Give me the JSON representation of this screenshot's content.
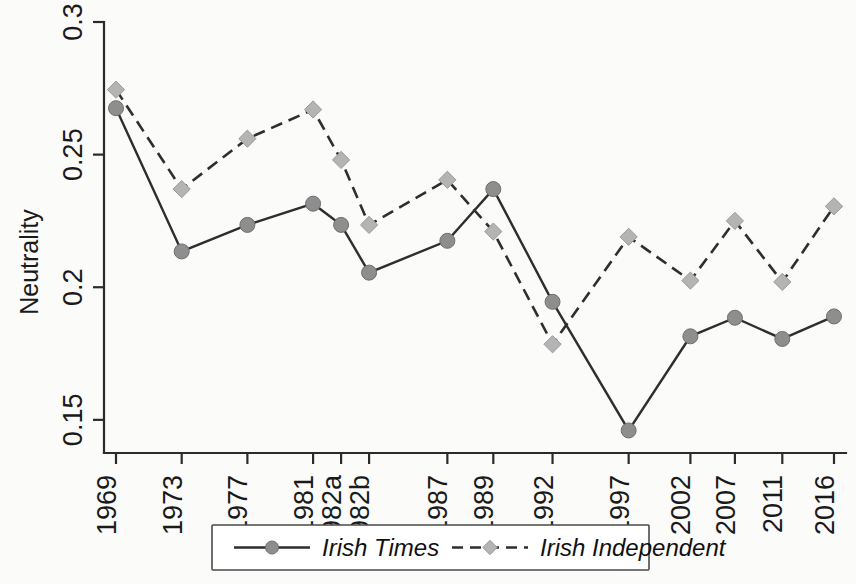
{
  "chart_data": {
    "type": "line",
    "title": "",
    "xlabel": "",
    "ylabel": "Neutrality",
    "ylim": [
      0.1375,
      0.3
    ],
    "grid": false,
    "legend_position": "bottom",
    "categories": [
      "1969",
      "1973",
      "1977",
      "1981",
      "1982a",
      "1982b",
      "1987",
      "1989",
      "1992",
      "1997",
      "2002",
      "2007",
      "2011",
      "2016"
    ],
    "y_ticks": [
      "0.15",
      "0.2",
      "0.25",
      "0.3"
    ],
    "y_tick_values": [
      0.15,
      0.2,
      0.25,
      0.3
    ],
    "series": [
      {
        "name": "Irish Times",
        "marker": "circle",
        "line_style": "solid",
        "values": [
          0.2675,
          0.2135,
          0.2235,
          0.2315,
          0.2235,
          0.2055,
          0.2175,
          0.237,
          0.1945,
          0.146,
          0.1815,
          0.1885,
          0.1805,
          0.189
        ]
      },
      {
        "name": "Irish Independent",
        "marker": "diamond",
        "line_style": "dashed",
        "values": [
          0.2745,
          0.237,
          0.256,
          0.267,
          0.248,
          0.2235,
          0.2405,
          0.221,
          0.1785,
          0.219,
          0.2025,
          0.225,
          0.202,
          0.2305
        ]
      }
    ]
  },
  "legend": {
    "items": [
      {
        "label": "Irish Times",
        "style": "solid-circle"
      },
      {
        "label": "Irish Independent",
        "style": "dashed-diamond"
      }
    ]
  },
  "colors": {
    "axis": "#2b2b2b",
    "line": "#2e2e2e",
    "marker_circle": "#8e8e8e",
    "marker_diamond": "#b4b4b4",
    "background": "#fbfbfa"
  }
}
